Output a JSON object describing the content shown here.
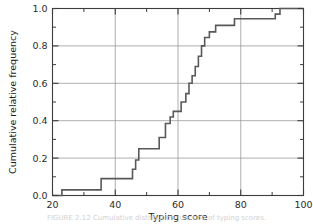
{
  "figure": {
    "caption": "FIGURE 2.12 Cumulative distribution function of typing scores."
  },
  "chart_data": {
    "type": "line",
    "subtype": "step-ecdf",
    "title": "",
    "xlabel": "Typing score",
    "ylabel": "Cumulative relative frequency",
    "xlim": [
      20,
      100
    ],
    "ylim": [
      0.0,
      1.0
    ],
    "grid": true,
    "grid_axes": "both",
    "legend": "none",
    "x_major_ticks": [
      20,
      40,
      60,
      80,
      100
    ],
    "x_major_tick_labels": [
      "20",
      "40",
      "60",
      "80",
      "100"
    ],
    "x_minor_ticks": [
      30,
      50,
      70,
      90
    ],
    "y_major_ticks": [
      0.0,
      0.2,
      0.4,
      0.6,
      0.8,
      1.0
    ],
    "y_major_tick_labels": [
      "0.0",
      "0.2",
      "0.4",
      "0.6",
      "0.8",
      "1.0"
    ],
    "y_minor_ticks": [
      0.1,
      0.3,
      0.5,
      0.7,
      0.9
    ],
    "line_color": "#595959",
    "grid_color": "#9a9a9a",
    "axis_color": "#3c3c3c",
    "steps": [
      {
        "x": 20.0,
        "y": 0.0
      },
      {
        "x": 23.0,
        "y": 0.0
      },
      {
        "x": 23.0,
        "y": 0.03
      },
      {
        "x": 35.5,
        "y": 0.03
      },
      {
        "x": 35.5,
        "y": 0.09
      },
      {
        "x": 45.5,
        "y": 0.09
      },
      {
        "x": 45.5,
        "y": 0.14
      },
      {
        "x": 46.5,
        "y": 0.14
      },
      {
        "x": 46.5,
        "y": 0.19
      },
      {
        "x": 47.5,
        "y": 0.19
      },
      {
        "x": 47.5,
        "y": 0.25
      },
      {
        "x": 54.0,
        "y": 0.25
      },
      {
        "x": 54.0,
        "y": 0.31
      },
      {
        "x": 56.0,
        "y": 0.31
      },
      {
        "x": 56.0,
        "y": 0.385
      },
      {
        "x": 57.5,
        "y": 0.385
      },
      {
        "x": 57.5,
        "y": 0.42
      },
      {
        "x": 58.5,
        "y": 0.42
      },
      {
        "x": 58.5,
        "y": 0.45
      },
      {
        "x": 61.0,
        "y": 0.45
      },
      {
        "x": 61.0,
        "y": 0.5
      },
      {
        "x": 62.5,
        "y": 0.5
      },
      {
        "x": 62.5,
        "y": 0.545
      },
      {
        "x": 63.5,
        "y": 0.545
      },
      {
        "x": 63.5,
        "y": 0.6
      },
      {
        "x": 64.5,
        "y": 0.6
      },
      {
        "x": 64.5,
        "y": 0.64
      },
      {
        "x": 65.5,
        "y": 0.64
      },
      {
        "x": 65.5,
        "y": 0.69
      },
      {
        "x": 66.5,
        "y": 0.69
      },
      {
        "x": 66.5,
        "y": 0.745
      },
      {
        "x": 67.5,
        "y": 0.745
      },
      {
        "x": 67.5,
        "y": 0.8
      },
      {
        "x": 68.5,
        "y": 0.8
      },
      {
        "x": 68.5,
        "y": 0.845
      },
      {
        "x": 70.0,
        "y": 0.845
      },
      {
        "x": 70.0,
        "y": 0.875
      },
      {
        "x": 72.0,
        "y": 0.875
      },
      {
        "x": 72.0,
        "y": 0.91
      },
      {
        "x": 78.0,
        "y": 0.91
      },
      {
        "x": 78.0,
        "y": 0.945
      },
      {
        "x": 91.0,
        "y": 0.945
      },
      {
        "x": 91.0,
        "y": 0.97
      },
      {
        "x": 92.5,
        "y": 0.97
      },
      {
        "x": 92.5,
        "y": 1.0
      },
      {
        "x": 100.0,
        "y": 1.0
      }
    ]
  }
}
